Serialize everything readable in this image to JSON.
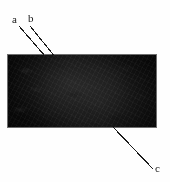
{
  "figure": {
    "type": "annotated-micrograph",
    "background_color": "#fefefe",
    "panel": {
      "name": "specimen-image",
      "fill_color": "#0a0a0a",
      "border_color": "#6e6e6e",
      "x": 7,
      "y": 54,
      "width": 150,
      "height": 74
    },
    "line_color": "#1c1c1c",
    "label_color": "#161616",
    "annotations": [
      {
        "id": "a",
        "label": "a",
        "label_x": 12,
        "label_y": 14,
        "leader": {
          "x1": 19,
          "y1": 26,
          "x2": 45,
          "y2": 56
        }
      },
      {
        "id": "b",
        "label": "b",
        "label_x": 28,
        "label_y": 13,
        "leader": {
          "x1": 30,
          "y1": 26,
          "x2": 56,
          "y2": 58
        }
      },
      {
        "id": "c",
        "label": "c",
        "label_x": 155,
        "label_y": 163,
        "leader": {
          "x1": 113,
          "y1": 127,
          "x2": 153,
          "y2": 169
        }
      }
    ]
  }
}
